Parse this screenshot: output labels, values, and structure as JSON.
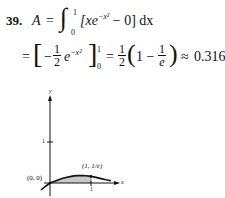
{
  "problem": {
    "number": "39.",
    "line1": {
      "lhs": "A",
      "eq": "=",
      "integral_lower": "0",
      "integral_upper": "1",
      "integrand": "[xe",
      "exponent": "−x²",
      "rest": " − 0] dx"
    },
    "line2": {
      "eq1": "=",
      "bracket_open": "[",
      "minus": "−",
      "frac1_num": "1",
      "frac1_den": "2",
      "e": "e",
      "exponent": "−x²",
      "bracket_close": "]",
      "eval_upper": "1",
      "eval_lower": "0",
      "eq2": "=",
      "frac2_num": "1",
      "frac2_den": "2",
      "paren_open": "(",
      "one_minus": "1 −",
      "frac3_num": "1",
      "frac3_den": "e",
      "paren_close": ")",
      "approx": "≈",
      "result": "0.316"
    }
  },
  "graph": {
    "y_axis_label": "y",
    "x_axis_label": "x",
    "y_tick_label": "1",
    "x_tick_label": "1",
    "origin_label": "(0, 0)",
    "point_label": "(1, 1/e)",
    "shaded_color": "#c8c8c8",
    "curve_color": "#111111"
  }
}
